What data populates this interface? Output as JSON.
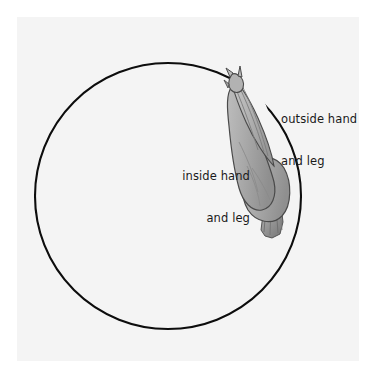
{
  "diagram": {
    "view": "overhead",
    "background_color": "#ffffff",
    "panel_color": "#f4f4f4",
    "track": {
      "name": "circle-track",
      "shape": "circle",
      "center_x": 168,
      "center_y": 196,
      "radius": 133,
      "stroke_color": "#0d0d0d",
      "stroke_width": 2.1
    },
    "horse": {
      "name": "horse-figure",
      "body_fill": "#a9a9a9",
      "outline_color": "#3a3a3a",
      "shade_color": "#8e8e8e",
      "highlight_color": "#c4c4c4",
      "position_on_circle": "upper-right",
      "heading_degrees": -35,
      "parts": [
        "head",
        "ears",
        "neck",
        "body",
        "hindquarters",
        "tail"
      ]
    },
    "labels": [
      {
        "id": "outside-hand-and-leg",
        "line1": "outside hand",
        "line2": "and leg",
        "align": "left",
        "x": 281,
        "y": 84
      },
      {
        "id": "inside-hand-and-leg",
        "line1": "inside hand",
        "line2": "and leg",
        "align": "right",
        "x": 250,
        "y": 141
      }
    ],
    "text_color": "#1a1a1a"
  }
}
